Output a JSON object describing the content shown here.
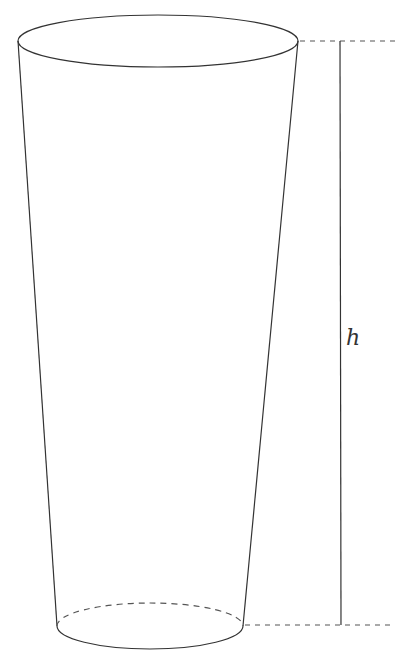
{
  "diagram": {
    "type": "truncated-cone (frustum)",
    "height_label": "h",
    "colors": {
      "stroke": "#333333",
      "dashed": "#555555",
      "background": "#ffffff"
    },
    "top_base": {
      "cx": 158,
      "cy": 41,
      "rx": 140,
      "ry": 26
    },
    "bottom_base": {
      "cx": 150,
      "cy": 626,
      "rx": 93,
      "ry": 23
    }
  }
}
